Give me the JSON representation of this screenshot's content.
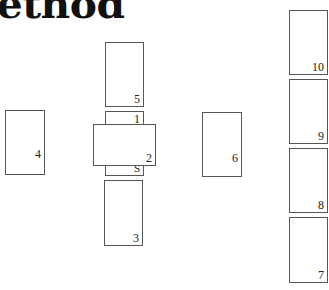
{
  "heading": "ethod",
  "spread": {
    "positions": [
      {
        "id": "1",
        "label": "1"
      },
      {
        "id": "2",
        "label": "2"
      },
      {
        "id": "3",
        "label": "3"
      },
      {
        "id": "4",
        "label": "4"
      },
      {
        "id": "5",
        "label": "5"
      },
      {
        "id": "6",
        "label": "6"
      },
      {
        "id": "7",
        "label": "7"
      },
      {
        "id": "8",
        "label": "8"
      },
      {
        "id": "9",
        "label": "9"
      },
      {
        "id": "10",
        "label": "10"
      },
      {
        "id": "S",
        "label": "S"
      }
    ]
  }
}
